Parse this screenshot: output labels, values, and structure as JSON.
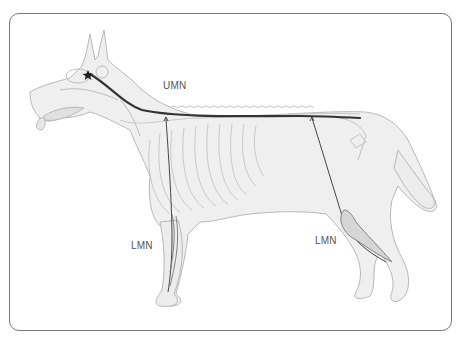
{
  "diagram": {
    "labels": {
      "umn": "UMN",
      "lmn_front": "LMN",
      "lmn_hind": "LMN"
    },
    "colors": {
      "frame": "#777777",
      "body_outline": "#b5b5b5",
      "body_fill": "#eeeeee",
      "skeleton": "#c4c4c4",
      "umn_tract": "#333333",
      "lmn_nerve": "#444444"
    }
  }
}
